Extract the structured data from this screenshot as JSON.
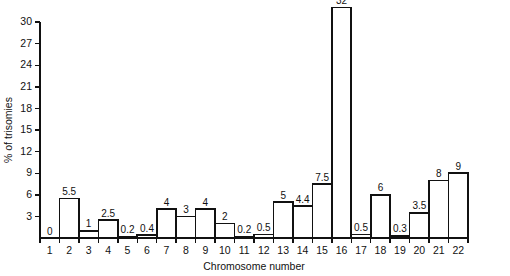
{
  "chart_data": {
    "type": "bar",
    "title": "",
    "xlabel": "Chromosome number",
    "ylabel": "% of trisomies",
    "categories": [
      "1",
      "2",
      "3",
      "4",
      "5",
      "6",
      "7",
      "8",
      "9",
      "10",
      "11",
      "12",
      "13",
      "14",
      "15",
      "16",
      "17",
      "18",
      "19",
      "20",
      "21",
      "22"
    ],
    "values": [
      0,
      5.5,
      1,
      2.5,
      0.2,
      0.4,
      4,
      3,
      4,
      2,
      0.2,
      0.5,
      5,
      4.4,
      7.5,
      32,
      0.5,
      6,
      0.3,
      3.5,
      8,
      9
    ],
    "value_labels": [
      "0",
      "5.5",
      "1",
      "2.5",
      "0.2",
      "0.4",
      "4",
      "3",
      "4",
      "2",
      "0.2",
      "0.5",
      "5",
      "4.4",
      "7.5",
      "32",
      "0.5",
      "6",
      "0.3",
      "3.5",
      "8",
      "9"
    ],
    "ylim": [
      0,
      30
    ],
    "yticks": [
      3,
      6,
      9,
      12,
      15,
      18,
      21,
      24,
      27,
      30
    ],
    "ytick_labels": [
      "3",
      "6",
      "9",
      "12",
      "15",
      "18",
      "21",
      "24",
      "27",
      "30"
    ],
    "grid": false,
    "legend": null
  },
  "style": {
    "bar_fill": "#ffffff",
    "bar_stroke": "#111111",
    "axis_color": "#111111",
    "background": "#ffffff"
  }
}
